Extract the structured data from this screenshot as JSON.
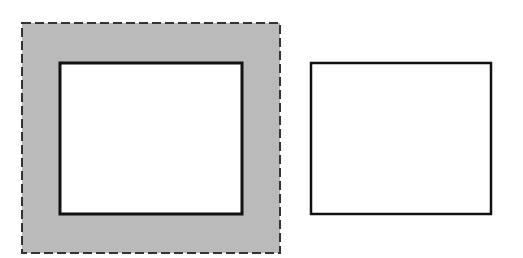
{
  "diagram": {
    "background": "#ffffff",
    "shapes": [
      {
        "id": "outer-dashed-region",
        "type": "rect",
        "x": 22,
        "y": 23,
        "width": 258,
        "height": 230,
        "fill": "#bababa",
        "stroke": "#333333",
        "stroke_width": 2,
        "dash": "9 4"
      },
      {
        "id": "inner-box-left",
        "type": "rect",
        "x": 60,
        "y": 63,
        "width": 182,
        "height": 151,
        "fill": "#ffffff",
        "stroke": "#111111",
        "stroke_width": 3,
        "dash": ""
      },
      {
        "id": "box-right",
        "type": "rect",
        "x": 311,
        "y": 63,
        "width": 180,
        "height": 151,
        "fill": "#ffffff",
        "stroke": "#111111",
        "stroke_width": 2.5,
        "dash": ""
      }
    ]
  }
}
